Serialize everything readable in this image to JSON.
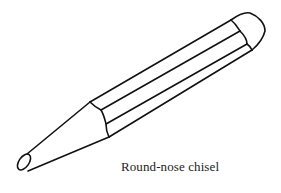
{
  "illustration": {
    "subject": "round-nose-chisel",
    "stroke_color": "#111111",
    "background": "#ffffff"
  },
  "caption": {
    "text": "Round-nose chisel"
  }
}
